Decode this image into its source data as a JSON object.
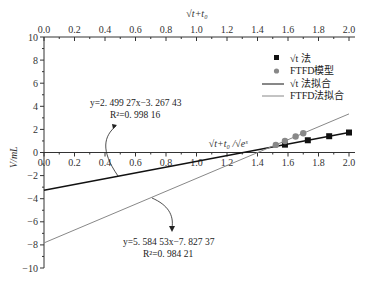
{
  "chart_data": {
    "type": "scatter",
    "title": "",
    "xlabel_top": "√(t+t0)",
    "xlabel_inner": "√(t+t0) /√(e^s)",
    "ylabel": "V/mL",
    "xlim": [
      0.0,
      2.0
    ],
    "ylim": [
      -10,
      10
    ],
    "x_ticks": [
      "0.0",
      "0.2",
      "0.4",
      "0.6",
      "0.8",
      "1.0",
      "1.2",
      "1.4",
      "1.6",
      "1.8",
      "2.0"
    ],
    "y_ticks": [
      "10",
      "8",
      "6",
      "4",
      "2",
      "0",
      "-2",
      "-4",
      "-6",
      "-8",
      "-10"
    ],
    "grid": false,
    "legend_position": "upper right",
    "series": [
      {
        "name": "√t 法",
        "marker": "square",
        "color": "#111111",
        "x": [
          1.58,
          1.73,
          1.87,
          2.0
        ],
        "y": [
          0.68,
          1.06,
          1.41,
          1.73
        ]
      },
      {
        "name": "FTFD模型",
        "marker": "circle",
        "color": "#888888",
        "x": [
          1.52,
          1.58,
          1.65,
          1.7
        ],
        "y": [
          0.66,
          1.0,
          1.39,
          1.67
        ]
      },
      {
        "name": "√t 法拟合",
        "type": "line",
        "color": "#111111",
        "slope": 2.49927,
        "intercept": -3.26743,
        "x_range": [
          0.0,
          2.0
        ]
      },
      {
        "name": "FTFD法拟合",
        "type": "line",
        "color": "#888888",
        "slope": 5.58453,
        "intercept": -7.82737,
        "x_range": [
          0.0,
          2.0
        ]
      }
    ],
    "annotations": [
      {
        "text": "y=2.499 27x−3.267 43",
        "r2": "R²=0.998 16"
      },
      {
        "text": "y=5.584 53x−7.827 37",
        "r2": "R²=0.984 21"
      }
    ]
  },
  "labels": {
    "ylabel": "V/mL",
    "top_axis": "√t+t₀",
    "inner_axis": "√t+t₀ /√eˢ",
    "eq1": "y=2. 499 27x−3. 267 43",
    "r1": "R²=0. 998 16",
    "eq2": "y=5. 584 53x−7. 827 37",
    "r2": "R²=0. 984 21",
    "legend": [
      "√t 法",
      "FTFD模型",
      "√t 法拟合",
      "FTFD法拟合"
    ]
  }
}
